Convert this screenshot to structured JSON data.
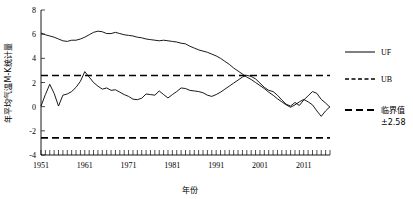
{
  "chart_data": {
    "type": "line",
    "title": "",
    "xlabel": "年份",
    "ylabel": "年平均气温M-K统计量",
    "xlim": [
      1951,
      2017
    ],
    "ylim": [
      -4,
      8
    ],
    "yticks": [
      8,
      6,
      4,
      2,
      0,
      -2,
      -4
    ],
    "xticks": [
      1951,
      1961,
      1971,
      1981,
      1991,
      2001,
      2011
    ],
    "grid": false,
    "legend_position": "right",
    "threshold_value": 2.58,
    "threshold_label": "临界值",
    "threshold_sublabel": "±2.58",
    "x": [
      1951,
      1952,
      1953,
      1954,
      1955,
      1956,
      1957,
      1958,
      1959,
      1960,
      1961,
      1962,
      1963,
      1964,
      1965,
      1966,
      1967,
      1968,
      1969,
      1970,
      1971,
      1972,
      1973,
      1974,
      1975,
      1976,
      1977,
      1978,
      1979,
      1980,
      1981,
      1982,
      1983,
      1984,
      1985,
      1986,
      1987,
      1988,
      1989,
      1990,
      1991,
      1992,
      1993,
      1994,
      1995,
      1996,
      1997,
      1998,
      1999,
      2000,
      2001,
      2002,
      2003,
      2004,
      2005,
      2006,
      2007,
      2008,
      2009,
      2010,
      2011,
      2012,
      2013,
      2014,
      2015,
      2016,
      2017
    ],
    "series": [
      {
        "name": "UF",
        "style": "solid",
        "values": [
          0.05,
          1.0,
          1.85,
          1.1,
          0.05,
          0.95,
          1.05,
          1.25,
          1.6,
          2.1,
          2.9,
          2.45,
          2.0,
          1.7,
          1.45,
          1.55,
          1.35,
          1.4,
          1.2,
          1.0,
          0.85,
          0.62,
          0.58,
          0.7,
          1.05,
          1.0,
          0.95,
          1.3,
          1.0,
          0.72,
          1.0,
          1.25,
          1.55,
          1.5,
          1.35,
          1.3,
          1.25,
          1.15,
          0.95,
          0.85,
          1.0,
          1.2,
          1.45,
          1.7,
          1.95,
          2.2,
          2.45,
          2.6,
          2.5,
          2.3,
          1.95,
          1.6,
          1.35,
          1.25,
          0.95,
          0.55,
          0.2,
          0.05,
          0.35,
          0.1,
          0.55,
          0.9,
          1.25,
          1.1,
          0.6,
          0.3,
          -0.05
        ]
      },
      {
        "name": "UB",
        "style": "solid",
        "values": [
          6.1,
          5.95,
          5.85,
          5.75,
          5.6,
          5.45,
          5.4,
          5.5,
          5.5,
          5.6,
          5.75,
          5.95,
          6.15,
          6.25,
          6.2,
          6.05,
          6.05,
          6.15,
          6.05,
          5.95,
          5.9,
          5.85,
          5.75,
          5.7,
          5.6,
          5.55,
          5.5,
          5.45,
          5.5,
          5.45,
          5.4,
          5.35,
          5.25,
          5.2,
          5.0,
          4.85,
          4.7,
          4.6,
          4.5,
          4.35,
          4.2,
          4.0,
          3.75,
          3.5,
          3.2,
          2.95,
          2.7,
          2.45,
          2.25,
          2.0,
          1.75,
          1.5,
          1.2,
          0.95,
          0.65,
          0.4,
          0.15,
          -0.05,
          0.15,
          0.4,
          0.6,
          0.4,
          0.15,
          -0.35,
          -0.8,
          -0.35,
          0.0
        ]
      }
    ],
    "legend": [
      {
        "label": "UF",
        "style": "solid"
      },
      {
        "label": "UB",
        "style": "short-dash"
      },
      {
        "label": "临界值",
        "sublabel": "±2.58",
        "style": "long-dash"
      }
    ]
  }
}
